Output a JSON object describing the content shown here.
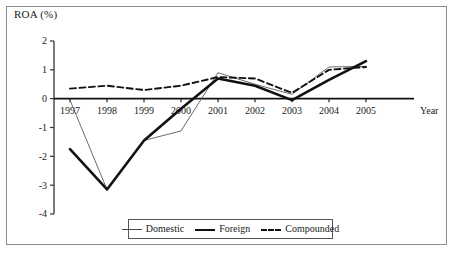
{
  "chart_data": {
    "type": "line",
    "title": "",
    "ylabel": "ROA (%)",
    "xlabel": "Year",
    "categories": [
      "1997",
      "1998",
      "1999",
      "2000",
      "2001",
      "2002",
      "2003",
      "2004",
      "2005"
    ],
    "ylim": [
      -4,
      2
    ],
    "yticks": [
      "2",
      "1",
      "0",
      "-1",
      "-2",
      "-3",
      "-4"
    ],
    "ytick_values": [
      2,
      1,
      0,
      -1,
      -2,
      -3,
      -4
    ],
    "grid": false,
    "legend_position": "bottom-center",
    "series": [
      {
        "name": "Domestic",
        "style": "thin-solid",
        "values": [
          -0.05,
          -3.15,
          -1.45,
          -1.12,
          0.9,
          0.5,
          0.15,
          1.1,
          1.12
        ]
      },
      {
        "name": "Foreign",
        "style": "thick-solid",
        "values": [
          -1.75,
          -3.15,
          -1.45,
          -0.35,
          0.7,
          0.45,
          -0.05,
          0.65,
          1.3
        ]
      },
      {
        "name": "Compounded",
        "style": "dashed",
        "values": [
          0.35,
          0.45,
          0.3,
          0.45,
          0.75,
          0.7,
          0.2,
          1.0,
          1.1
        ]
      }
    ]
  },
  "legend": {
    "items": [
      {
        "label": "Domestic"
      },
      {
        "label": "Foreign"
      },
      {
        "label": "Compounded"
      }
    ]
  },
  "colors": {
    "domestic": "#5a5a5a",
    "foreign": "#111111",
    "compounded": "#111111",
    "axis": "#333333",
    "frame": "#8c8c8c"
  }
}
